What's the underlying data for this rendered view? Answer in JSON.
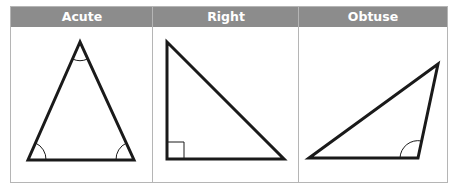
{
  "columns": [
    {
      "label": "Acute"
    },
    {
      "label": "Right"
    },
    {
      "label": "Obtuse"
    }
  ],
  "colors": {
    "header_bg": "#8c8c8c",
    "header_text": "#ffffff",
    "border": "#b5b5b5",
    "stroke": "#1a1a1a"
  },
  "triangles": {
    "acute": {
      "points": [
        [
          80,
          42
        ],
        [
          28,
          160
        ],
        [
          134,
          160
        ]
      ],
      "angle_marks": [
        "apex",
        "bottom-left",
        "bottom-right"
      ]
    },
    "right": {
      "points": [
        [
          167,
          42
        ],
        [
          167,
          159
        ],
        [
          284,
          159
        ]
      ],
      "angle_marks": [
        "right-angle-square"
      ]
    },
    "obtuse": {
      "points": [
        [
          309,
          158
        ],
        [
          438,
          64
        ],
        [
          418,
          158
        ]
      ],
      "angle_marks": [
        "obtuse-vertex"
      ]
    }
  }
}
